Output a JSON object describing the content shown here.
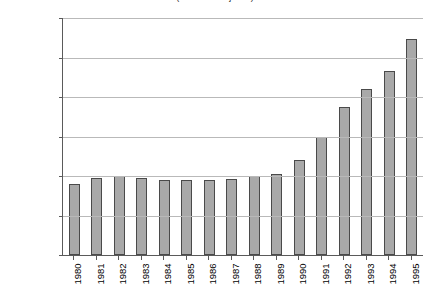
{
  "chart_data": {
    "type": "bar",
    "title": "(number of injuries)",
    "xlabel": "",
    "ylabel": "",
    "categories": [
      "1980",
      "1981",
      "1982",
      "1983",
      "1984",
      "1985",
      "1986",
      "1987",
      "1988",
      "1989",
      "1990",
      "1991",
      "1992",
      "1993",
      "1994",
      "1995"
    ],
    "values": [
      9000,
      9800,
      9950,
      9750,
      9500,
      9500,
      9500,
      9600,
      10000,
      10200,
      12000,
      14900,
      18700,
      21000,
      23300,
      27400
    ],
    "ylim": [
      0,
      30000
    ],
    "ytick_labels": [
      "30,000",
      "25,000",
      "20,000",
      "15,000",
      "10,000",
      "5,000",
      "0"
    ],
    "ytick_values": [
      30000,
      25000,
      20000,
      15000,
      10000,
      5000,
      0
    ],
    "grid": true,
    "legend": "none",
    "bar_color": "#a9a9a9",
    "bar_border_color": "#4a4a4a",
    "gridline_color": "#b9b9b9",
    "axis_color": "#5a5a5a"
  }
}
